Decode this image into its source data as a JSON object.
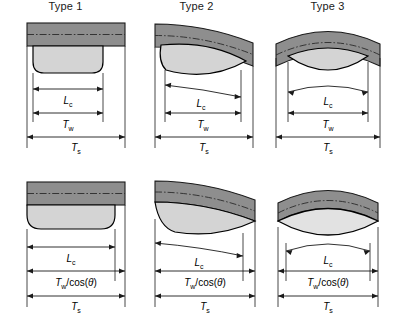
{
  "figure": {
    "rows": 2,
    "columns": 3,
    "background": "#ffffff"
  },
  "colors": {
    "sheet_band": "#8e8e8e",
    "band_stroke": "#1a1a1a",
    "nugget_fill": "#d4d4d4",
    "nugget_stroke": "#000000",
    "dimension_line": "#1a1a1a",
    "centerline": "#2a2a2a",
    "text": "#000000"
  },
  "panels": [
    {
      "id": "type-1-top",
      "row": "top",
      "column": 1,
      "title": "Type 1",
      "band_shape": "flat",
      "nugget_shape": "rounded-rectangle",
      "dimensions": [
        {
          "name": "Lc",
          "symbol": "L",
          "subscript": "c",
          "label": "Lc"
        },
        {
          "name": "Tw",
          "symbol": "T",
          "subscript": "w",
          "label": "Tw"
        },
        {
          "name": "Ts",
          "symbol": "T",
          "subscript": "s",
          "label": "Ts"
        }
      ]
    },
    {
      "id": "type-2-top",
      "row": "top",
      "column": 2,
      "title": "Type 2",
      "band_shape": "tilted",
      "nugget_shape": "tilted-lens",
      "dimensions": [
        {
          "name": "Lc",
          "symbol": "L",
          "subscript": "c",
          "label": "Lc"
        },
        {
          "name": "Tw",
          "symbol": "T",
          "subscript": "w",
          "label": "Tw"
        },
        {
          "name": "Ts",
          "symbol": "T",
          "subscript": "s",
          "label": "Ts"
        }
      ]
    },
    {
      "id": "type-3-top",
      "row": "top",
      "column": 3,
      "title": "Type 3",
      "band_shape": "arched",
      "nugget_shape": "ellipse",
      "dimensions": [
        {
          "name": "Lc",
          "symbol": "L",
          "subscript": "c",
          "label": "Lc"
        },
        {
          "name": "Tw",
          "symbol": "T",
          "subscript": "w",
          "label": "Tw"
        },
        {
          "name": "Ts",
          "symbol": "T",
          "subscript": "s",
          "label": "Ts"
        }
      ]
    },
    {
      "id": "type-1-bottom",
      "row": "bottom",
      "column": 1,
      "title": "",
      "band_shape": "flat",
      "nugget_shape": "wide-rounded-rectangle",
      "dimensions": [
        {
          "name": "Lc",
          "symbol": "L",
          "subscript": "c",
          "label": "Lc"
        },
        {
          "name": "Tw-cos",
          "symbol": "T",
          "subscript": "w",
          "suffix": "/cos(θ)",
          "label": "Tw/cos(θ)"
        },
        {
          "name": "Ts",
          "symbol": "T",
          "subscript": "s",
          "label": "Ts"
        }
      ]
    },
    {
      "id": "type-2-bottom",
      "row": "bottom",
      "column": 2,
      "title": "",
      "band_shape": "tilted",
      "nugget_shape": "wide-tilted-lens",
      "dimensions": [
        {
          "name": "Lc",
          "symbol": "L",
          "subscript": "c",
          "label": "Lc"
        },
        {
          "name": "Tw-cos",
          "symbol": "T",
          "subscript": "w",
          "suffix": "/cos(θ)",
          "label": "Tw/cos(θ)"
        },
        {
          "name": "Ts",
          "symbol": "T",
          "subscript": "s",
          "label": "Ts"
        }
      ]
    },
    {
      "id": "type-3-bottom",
      "row": "bottom",
      "column": 3,
      "title": "",
      "band_shape": "arched",
      "nugget_shape": "wide-ellipse",
      "dimensions": [
        {
          "name": "Lc",
          "symbol": "L",
          "subscript": "c",
          "label": "Lc"
        },
        {
          "name": "Tw-cos",
          "symbol": "T",
          "subscript": "w",
          "suffix": "/cos(θ)",
          "label": "Tw/cos(θ)"
        },
        {
          "name": "Ts",
          "symbol": "T",
          "subscript": "s",
          "label": "Ts"
        }
      ]
    }
  ],
  "symbols": {
    "L": "L",
    "T": "T",
    "sub_c": "c",
    "sub_w": "w",
    "sub_s": "s",
    "cos_suffix": "/cos(θ)",
    "theta": "θ"
  },
  "titles": {
    "type1": "Type 1",
    "type2": "Type 2",
    "type3": "Type 3"
  }
}
